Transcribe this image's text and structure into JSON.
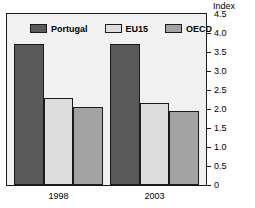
{
  "chart_data": {
    "type": "bar",
    "title": "",
    "subtitle": "",
    "xlabel": "",
    "ylabel": "Index",
    "axis_unit": "Index",
    "categories": [
      "1998",
      "2003"
    ],
    "series": [
      {
        "name": "Portugal",
        "color": "#595959",
        "values": [
          3.7,
          3.7
        ]
      },
      {
        "name": "EU15",
        "color": "#dcdcdc",
        "values": [
          2.3,
          2.15
        ]
      },
      {
        "name": "OECD",
        "color": "#a3a3a3",
        "values": [
          2.05,
          1.95
        ]
      }
    ],
    "ylim": [
      0,
      4.5
    ],
    "ytick_labels": [
      "4.5",
      "4.0",
      "3.5",
      "3.0",
      "2.5",
      "2.0",
      "1.5",
      "1.0",
      "0.5",
      "0"
    ],
    "ytick_values": [
      4.5,
      4.0,
      3.5,
      3.0,
      2.5,
      2.0,
      1.5,
      1.0,
      0.5,
      0
    ],
    "grid": false,
    "legend_position": "inside-top",
    "legend_entries": [
      "Portugal",
      "EU15",
      "OECD"
    ],
    "plot_background": "#f1f1f1",
    "frame_color": "#1a1a1a"
  }
}
